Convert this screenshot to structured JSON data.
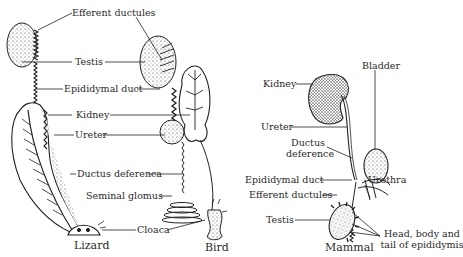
{
  "diagram": {
    "type": "comparative anatomy - male urogenital system",
    "panels": [
      {
        "caption": "Lizard"
      },
      {
        "caption": "Bird"
      },
      {
        "caption": "Mammal"
      }
    ],
    "shared_labels": {
      "efferent_ductules": "Efferent ductules",
      "testis": "Testis",
      "epididymal_duct": "Epididymal duct",
      "kidney": "Kidney",
      "ureter": "Ureter",
      "ductus_deferens": "Ductus deferenca",
      "seminal_glomus": "Seminal glomus",
      "cloaca": "Cloaca"
    },
    "mammal_labels": {
      "kidney": "Kidney",
      "bladder": "Bladder",
      "ureter": "Ureter",
      "ductus_deference_line1": "Ductus",
      "ductus_deference_line2": "deference",
      "urethra": "Urethra",
      "epididymal_duct": "Epididymal duct",
      "efferent_ductules": "Efferent ductules",
      "testis": "Testis",
      "epididymis_line1": "Head, body and",
      "epididymis_line2": "tail of epididymis"
    },
    "colors": {
      "ink": "#222222",
      "background": "#ffffff"
    }
  }
}
